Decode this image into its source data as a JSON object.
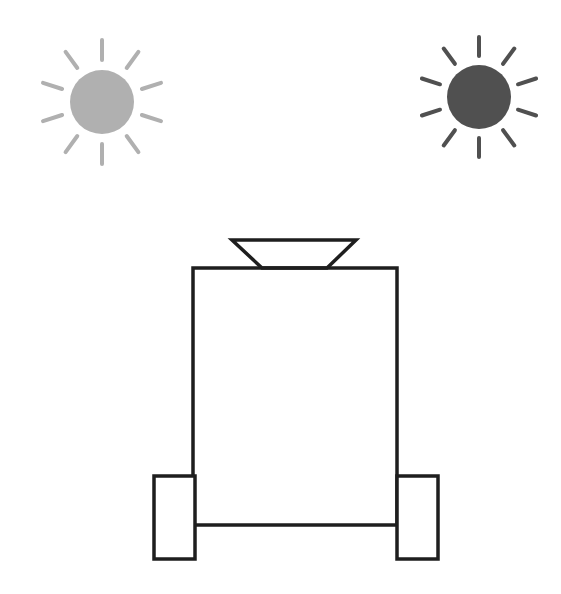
{
  "diagram": {
    "colors": {
      "background": "#ffffff",
      "outline": "#1e1e1e",
      "light_dim": "#b0b0b0",
      "light_bright": "#505050"
    },
    "light_sources": [
      {
        "name": "dim-light-source",
        "cx": 102,
        "cy": 102,
        "r": 32,
        "ray_inner": 42,
        "ray_outer": 62,
        "color": "#b0b0b0"
      },
      {
        "name": "bright-light-source",
        "cx": 479,
        "cy": 97,
        "r": 32,
        "ray_inner": 41,
        "ray_outer": 60,
        "color": "#505050"
      }
    ],
    "robot": {
      "body": {
        "x": 193,
        "y": 268,
        "w": 204,
        "h": 257
      },
      "sensor": {
        "top_left": 232,
        "top_right": 356,
        "top_y": 240,
        "bottom_left": 262,
        "bottom_right": 327,
        "bottom_y": 268
      },
      "wheels": [
        {
          "name": "left-wheel",
          "x": 154,
          "y": 476,
          "w": 41,
          "h": 83
        },
        {
          "name": "right-wheel",
          "x": 397,
          "y": 476,
          "w": 41,
          "h": 83
        }
      ]
    }
  }
}
